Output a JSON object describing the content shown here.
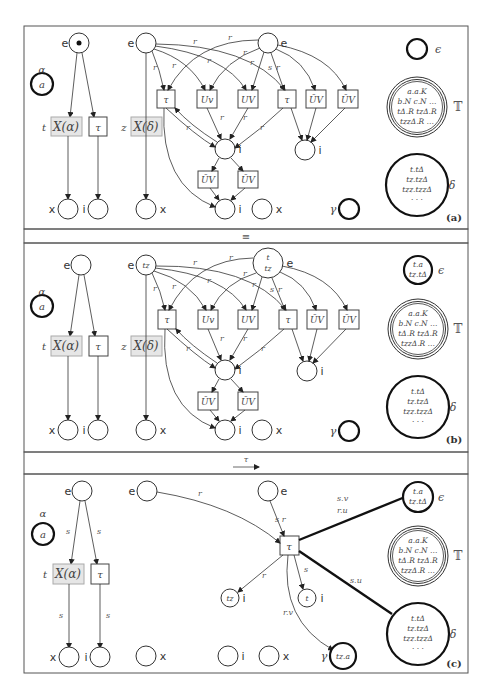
{
  "figure": {
    "panels": [
      {
        "id": "a",
        "label": "(a)",
        "left_net": {
          "place_top_label": "e",
          "place_top_token": "•",
          "alpha_label": "α",
          "alpha_token": "a",
          "trans_x_label": "t",
          "trans_x_text": "X(α)",
          "trans_tau_text": "τ",
          "bottom_left_label": "x",
          "bottom_right_label": "i"
        },
        "mid_net": {
          "place_e_label": "e",
          "place_e_token": "",
          "place_e2_label": "e",
          "place_e2_token_1": "",
          "place_e2_token_2": "",
          "trans_z_label": "z",
          "trans_z_text": "X(δ)",
          "transitions": [
            "τ",
            "Uv",
            "UV",
            "τ",
            "ŪV",
            "ŪV"
          ],
          "lower_transitions": [
            "ŪV",
            "ŪV"
          ],
          "place_i_labels": [
            "i",
            "i",
            "i"
          ],
          "place_x_labels": [
            "x",
            "x"
          ],
          "edge_labels": [
            "r",
            "r",
            "r",
            "r",
            "r",
            "r",
            "r",
            "s",
            "r",
            "r",
            "r",
            "r",
            "r"
          ]
        },
        "right_places": {
          "epsilon_label": "ϵ",
          "epsilon_tokens": [],
          "T_label": "𝕋",
          "T_tokens": [
            "a.a.K",
            "b.N  c.N  …",
            "tΔ.R  tzΔ.R",
            "tzzΔ.R …"
          ],
          "delta_label": "δ",
          "delta_tokens": [
            "t.tΔ",
            "tz.tzΔ",
            "tzz.tzzΔ",
            "· · ·"
          ],
          "gamma_label": "γ",
          "gamma_token": ""
        }
      },
      {
        "id": "b",
        "label": "(b)",
        "left_net": {
          "place_top_label": "e",
          "place_top_token": "",
          "alpha_label": "α",
          "alpha_token": "a",
          "trans_x_label": "t",
          "trans_x_text": "X(α)",
          "trans_tau_text": "τ",
          "bottom_left_label": "x",
          "bottom_right_label": "i"
        },
        "mid_net": {
          "place_e_label": "e",
          "place_e_token": "tz",
          "place_e2_label": "e",
          "place_e2_token_1": "t",
          "place_e2_token_2": "tz",
          "trans_z_label": "z",
          "trans_z_text": "X(δ)",
          "transitions": [
            "τ",
            "Uv",
            "UV",
            "τ",
            "ŪV",
            "ŪV"
          ],
          "lower_transitions": [
            "ŪV",
            "ŪV"
          ],
          "place_i_labels": [
            "i",
            "i",
            "i"
          ],
          "place_x_labels": [
            "x",
            "x"
          ],
          "edge_labels": [
            "r",
            "r",
            "r",
            "r",
            "r",
            "r",
            "r",
            "s",
            "r",
            "r",
            "r",
            "r",
            "r"
          ]
        },
        "right_places": {
          "epsilon_label": "ϵ",
          "epsilon_tokens": [
            "t.a",
            "tz.tΔ"
          ],
          "T_label": "𝕋",
          "T_tokens": [
            "a.a.K",
            "b.N  c.N  …",
            "tΔ.R  tzΔ.R",
            "tzzΔ.R …"
          ],
          "delta_label": "δ",
          "delta_tokens": [
            "t.tΔ",
            "tz.tzΔ",
            "tzz.tzzΔ",
            "· · ·"
          ],
          "gamma_label": "γ",
          "gamma_token": ""
        }
      },
      {
        "id": "c",
        "label": "(c)",
        "left_net": {
          "place_top_label": "e",
          "alpha_label": "α",
          "alpha_token": "a",
          "trans_x_label": "t",
          "trans_x_text": "X(α)",
          "trans_tau_text": "τ",
          "bottom_left_label": "x",
          "bottom_right_label": "i",
          "edge_labels": [
            "s",
            "s",
            "s",
            "s"
          ]
        },
        "mid_net": {
          "place_e_label": "e",
          "place_e2_label": "e",
          "trans_tau_text": "τ",
          "place_tz_token": "tz",
          "place_tz_label": "i",
          "place_t_token": "t",
          "place_t_label": "i",
          "place_x_label": "x",
          "place_i_label": "i",
          "place_x2_label": "x",
          "edge_r_top": "r",
          "edge_sr": "s r",
          "edge_r_left": "r",
          "edge_s_down": "s",
          "edge_rv": "r.v",
          "edge_sv": "s.v",
          "edge_ru": "r.u",
          "edge_su": "s.u"
        },
        "right_places": {
          "epsilon_label": "ϵ",
          "epsilon_tokens": [
            "t.a",
            "tz.tΔ"
          ],
          "T_label": "𝕋",
          "T_tokens": [
            "a.a.K",
            "b.N  c.N  …",
            "tΔ.R  tzΔ.R",
            "tzzΔ.R …"
          ],
          "delta_label": "δ",
          "delta_tokens": [
            "t.tΔ",
            "tz.tzΔ",
            "tzz.tzzΔ",
            "· · ·"
          ],
          "gamma_label": "γ",
          "gamma_token": "tz.a"
        }
      }
    ],
    "separators": {
      "ab": "≡",
      "bc_label": "τ",
      "bc_arrow": "⟶"
    }
  }
}
